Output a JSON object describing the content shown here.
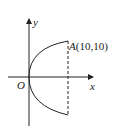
{
  "figure": {
    "axes": {
      "x_label": "x",
      "y_label": "y",
      "origin_label": "O"
    },
    "point_a": {
      "name": "A",
      "coords": "(10,10)",
      "x": 10,
      "y": 10
    },
    "curve": {
      "type": "parabola",
      "equation": "y^2 = 10x",
      "from": [
        10,
        -10
      ],
      "to": [
        10,
        10
      ]
    },
    "dashed_line": {
      "x": 10,
      "from_y": -10,
      "to_y": 10
    },
    "colors": {
      "stroke": "#222222",
      "background": "#ffffff"
    }
  }
}
